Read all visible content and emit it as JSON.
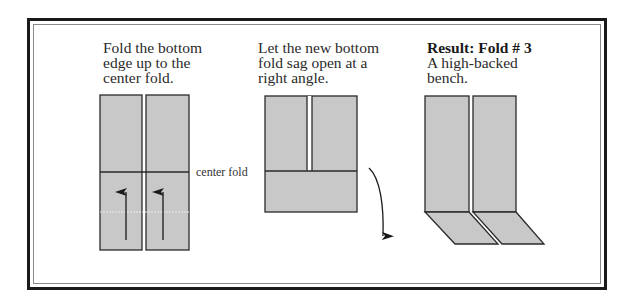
{
  "steps": [
    {
      "caption": "Fold the bottom\nedge up to the\ncenter fold."
    },
    {
      "caption": "Let the new bottom\nfold sag open at a\nright angle."
    },
    {
      "title": "Result: Fold # 3",
      "caption": "A high-backed\nbench."
    }
  ],
  "labels": {
    "center_fold": "center fold"
  },
  "colors": {
    "paper_fill": "#c8c8c8",
    "stroke": "#2a2a2a",
    "frame": "#1a1a1a"
  }
}
